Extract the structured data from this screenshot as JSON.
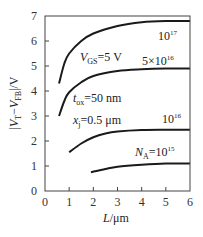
{
  "chart_data": {
    "type": "line",
    "title": "",
    "xlabel": "L/μm",
    "ylabel": "|V_T − V_FB|/V",
    "xlim": [
      0,
      6
    ],
    "ylim": [
      0,
      7
    ],
    "x_ticks": [
      "0",
      "1",
      "2",
      "3",
      "4",
      "5",
      "6"
    ],
    "y_ticks": [
      "0",
      "1",
      "2",
      "3",
      "4",
      "5",
      "6",
      "7"
    ],
    "grid": false,
    "legend": "inline labels",
    "annotations": {
      "vgs": "V_GS=5 V",
      "tox": "t_ox=50 nm",
      "xj": "x_j=0.5 μm"
    },
    "series": [
      {
        "name": "N_A=10^17",
        "label": "10",
        "exp": "17",
        "x": [
          0.58,
          0.8,
          1.0,
          1.5,
          2.0,
          3.0,
          4.0,
          5.0,
          6.0
        ],
        "y": [
          4.3,
          5.1,
          5.5,
          6.0,
          6.3,
          6.6,
          6.75,
          6.8,
          6.8
        ]
      },
      {
        "name": "N_A=5×10^16",
        "label": "5×10",
        "exp": "16",
        "x": [
          0.58,
          0.8,
          1.0,
          1.5,
          2.0,
          3.0,
          4.0,
          5.0,
          6.0
        ],
        "y": [
          3.0,
          3.6,
          3.95,
          4.35,
          4.6,
          4.8,
          4.87,
          4.9,
          4.9
        ]
      },
      {
        "name": "N_A=10^16",
        "label": "10",
        "exp": "16",
        "x": [
          1.0,
          1.5,
          2.0,
          2.5,
          3.0,
          4.0,
          5.0,
          6.0
        ],
        "y": [
          1.55,
          1.9,
          2.15,
          2.3,
          2.38,
          2.44,
          2.45,
          2.45
        ]
      },
      {
        "name": "N_A=10^15",
        "label": "N_A=10",
        "exp": "15",
        "x": [
          1.9,
          2.5,
          3.0,
          4.0,
          5.0,
          6.0
        ],
        "y": [
          0.75,
          0.88,
          0.97,
          1.05,
          1.1,
          1.1
        ]
      }
    ]
  }
}
